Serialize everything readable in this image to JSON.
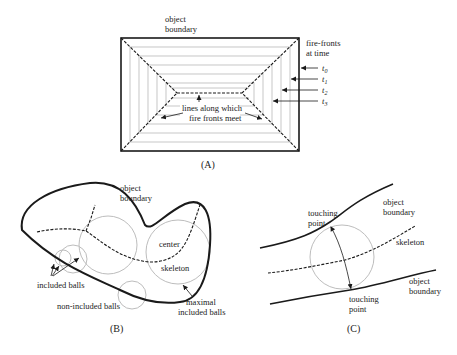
{
  "panels": {
    "A": {
      "caption": "(A)",
      "labels": {
        "object_boundary_1": "object",
        "object_boundary_2": "boundary",
        "fire_fronts_1": "fire-fronts",
        "fire_fronts_2": "at time",
        "t0": "t",
        "t0_sub": "0",
        "t1": "t",
        "t1_sub": "1",
        "t2": "t",
        "t2_sub": "2",
        "t3": "t",
        "t3_sub": "3",
        "meet_1": "lines along which",
        "meet_2": "fire fronts meet"
      }
    },
    "B": {
      "caption": "(B)",
      "labels": {
        "object_boundary_1": "object",
        "object_boundary_2": "boundary",
        "center": "center",
        "skeleton": "skeleton",
        "included_balls": "included balls",
        "non_included_balls": "non-included balls",
        "maximal_1": "maximal",
        "maximal_2": "included balls"
      }
    },
    "C": {
      "caption": "(C)",
      "labels": {
        "touching_top_1": "touching",
        "touching_top_2": "point",
        "object_boundary_top_1": "object",
        "object_boundary_top_2": "boundary",
        "skeleton": "skeleton",
        "object_boundary_bottom_1": "object",
        "object_boundary_bottom_2": "boundary",
        "touching_bottom_1": "touching",
        "touching_bottom_2": "point"
      }
    }
  }
}
